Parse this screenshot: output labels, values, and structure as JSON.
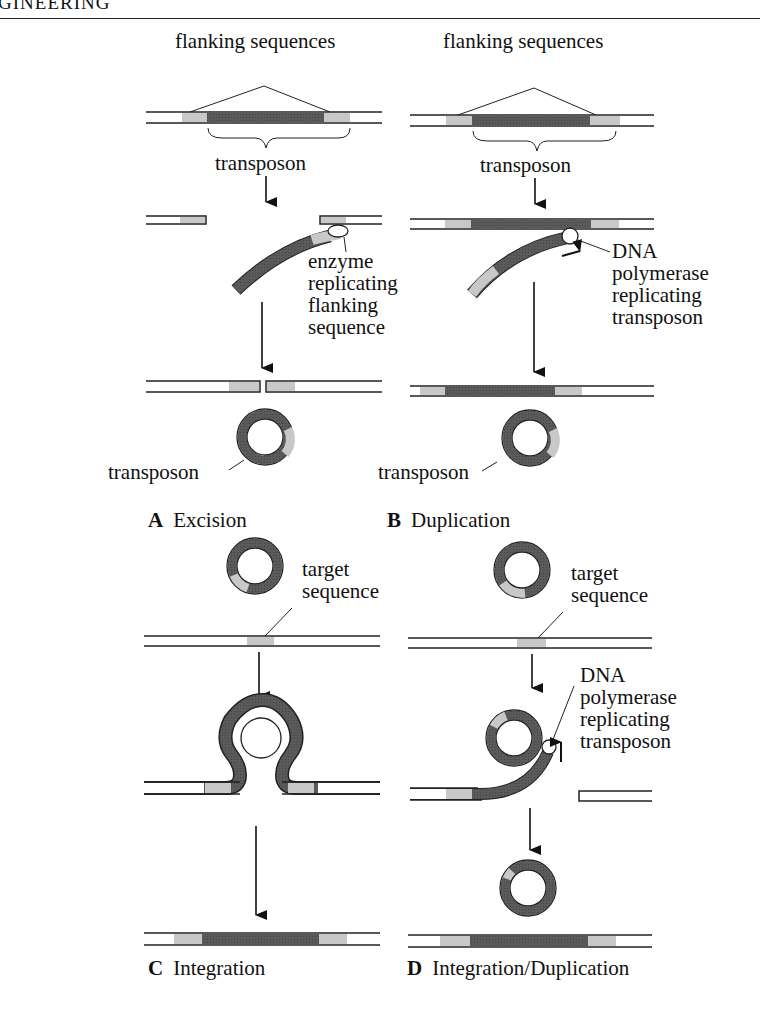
{
  "header": {
    "running_title": "GINEERING"
  },
  "colors": {
    "transposon": "#555555",
    "flanking": "#c8c8c8",
    "dna_line": "#222222",
    "background": "#ffffff"
  },
  "panels": [
    {
      "id": "A",
      "letter": "A",
      "title": "Excision",
      "labels": {
        "top": "flanking sequences",
        "brace": "transposon",
        "enzyme_1": "enzyme",
        "enzyme_2": "replicating",
        "enzyme_3": "flanking",
        "enzyme_4": "sequence",
        "circle": "transposon"
      }
    },
    {
      "id": "B",
      "letter": "B",
      "title": "Duplication",
      "labels": {
        "top": "flanking sequences",
        "brace": "transposon",
        "poly_1": "DNA",
        "poly_2": "polymerase",
        "poly_3": "replicating",
        "poly_4": "transposon",
        "circle": "transposon"
      }
    },
    {
      "id": "C",
      "letter": "C",
      "title": "Integration",
      "labels": {
        "target_1": "target",
        "target_2": "sequence"
      }
    },
    {
      "id": "D",
      "letter": "D",
      "title": "Integration/Duplication",
      "labels": {
        "target_1": "target",
        "target_2": "sequence",
        "poly_1": "DNA",
        "poly_2": "polymerase",
        "poly_3": "replicating",
        "poly_4": "transposon"
      }
    }
  ]
}
